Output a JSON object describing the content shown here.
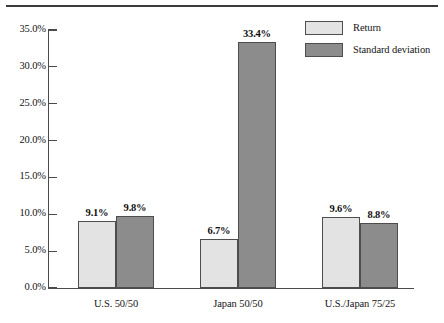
{
  "chart_data": {
    "type": "bar",
    "title": "",
    "xlabel": "",
    "ylabel": "",
    "ylim": [
      0,
      35
    ],
    "grid": false,
    "legend_position": "top-right",
    "categories": [
      "U.S. 50/50",
      "Japan 50/50",
      "U.S./Japan 75/25"
    ],
    "series": [
      {
        "name": "Return",
        "color": "#e3e3e3",
        "values": [
          9.1,
          9.8,
          6.7
        ],
        "labels": [
          "9.1%",
          "6.7%",
          "9.6%"
        ],
        "values_by_category": [
          9.1,
          6.7,
          9.6
        ]
      },
      {
        "name": "Standard deviation",
        "color": "#8c8c8c",
        "values": [
          9.8,
          33.4,
          8.8
        ],
        "labels": [
          "9.8%",
          "33.4%",
          "8.8%"
        ],
        "values_by_category": [
          9.8,
          33.4,
          8.8
        ]
      }
    ],
    "yticks": [
      0,
      5,
      10,
      15,
      20,
      25,
      30,
      35
    ],
    "ytick_labels": [
      "0.0%",
      "5.0%",
      "10.0%",
      "15.0%",
      "20.0%",
      "25.0%",
      "30.0%",
      "35.0%"
    ]
  },
  "axis": {
    "ytick_labels": [
      "35.0%",
      "30.0%",
      "25.0%",
      "20.0%",
      "15.0%",
      "10.0%",
      "5.0%",
      "0.0%"
    ]
  },
  "legend": {
    "items": [
      {
        "label": "Return",
        "color": "#e3e3e3"
      },
      {
        "label": "Standard deviation",
        "color": "#8c8c8c"
      }
    ]
  },
  "groups": [
    {
      "category": "U.S. 50/50",
      "bars": [
        {
          "label": "9.1%",
          "value": 9.1,
          "series": "Return"
        },
        {
          "label": "9.8%",
          "value": 9.8,
          "series": "Standard deviation"
        }
      ]
    },
    {
      "category": "Japan 50/50",
      "bars": [
        {
          "label": "6.7%",
          "value": 6.7,
          "series": "Return"
        },
        {
          "label": "33.4%",
          "value": 33.4,
          "series": "Standard deviation"
        }
      ]
    },
    {
      "category": "U.S./Japan 75/25",
      "bars": [
        {
          "label": "9.6%",
          "value": 9.6,
          "series": "Return"
        },
        {
          "label": "8.8%",
          "value": 8.8,
          "series": "Standard deviation"
        }
      ]
    }
  ]
}
